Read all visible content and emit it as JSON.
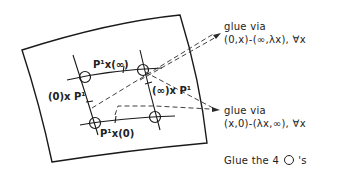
{
  "diagram": {
    "curve_labels": {
      "top": "P¹x(∞)",
      "bottom": "P¹x(0)",
      "left": "(0)x P¹",
      "right": "(∞)x P¹"
    },
    "annotations": {
      "glue_top_line1": "glue via",
      "glue_top_line2": "(0,x)-(∞,λx), ∀x",
      "glue_bottom_line1": "glue via",
      "glue_bottom_line2": "(x,0)-(λx,∞), ∀x",
      "glue_circles_prefix": "Glue the  4",
      "glue_circles_suffix": "'s"
    },
    "points": [
      {
        "name": "top-left-point",
        "x": 85,
        "y": 77
      },
      {
        "name": "top-right-point",
        "x": 143,
        "y": 70
      },
      {
        "name": "bottom-left-point",
        "x": 95,
        "y": 123
      },
      {
        "name": "bottom-right-point",
        "x": 155,
        "y": 117
      }
    ],
    "colors": {
      "ink": "#1a1a1a",
      "background": "#ffffff"
    }
  }
}
